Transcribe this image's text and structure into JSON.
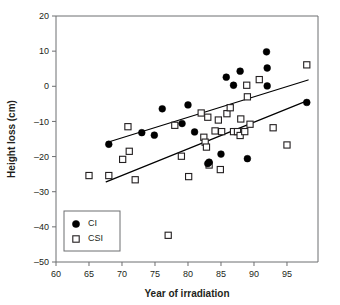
{
  "chart_data": {
    "type": "scatter",
    "title": "",
    "xlabel": "Year of irradiation",
    "ylabel": "Height loss (cm)",
    "xlim": [
      60,
      99.7
    ],
    "ylim": [
      -50,
      20
    ],
    "xticks": [
      60,
      65,
      70,
      75,
      80,
      85,
      90,
      95
    ],
    "yticks": [
      20,
      10,
      0,
      -10,
      -20,
      -30,
      -40,
      -50
    ],
    "xticklabels": [
      "60",
      "65",
      "70",
      "75",
      "80",
      "85",
      "90",
      "95"
    ],
    "yticklabels": [
      "20",
      "10",
      "0",
      "–10",
      "–20",
      "–30",
      "–40",
      "–50"
    ],
    "grid": false,
    "legend_position": "lower-left",
    "series": [
      {
        "name": "CI",
        "marker": "filled-circle",
        "color": "#000000",
        "points": [
          [
            68.0,
            -16.5
          ],
          [
            73.0,
            -13.2
          ],
          [
            74.9,
            -13.9
          ],
          [
            76.1,
            -6.4
          ],
          [
            79.1,
            -10.6
          ],
          [
            80.0,
            -5.3
          ],
          [
            81.0,
            -13.0
          ],
          [
            83.0,
            -22.0
          ],
          [
            83.2,
            -21.6
          ],
          [
            85.0,
            -19.3
          ],
          [
            85.8,
            2.6
          ],
          [
            86.9,
            0.3
          ],
          [
            87.9,
            4.3
          ],
          [
            89.0,
            -20.6
          ],
          [
            91.9,
            9.8
          ],
          [
            92.0,
            5.2
          ],
          [
            92.0,
            0.1
          ],
          [
            98.0,
            -4.6
          ]
        ]
      },
      {
        "name": "CSI",
        "marker": "open-square",
        "color": "#ffffff",
        "points": [
          [
            65.0,
            -25.4
          ],
          [
            68.0,
            -25.4
          ],
          [
            70.1,
            -20.8
          ],
          [
            70.9,
            -11.5
          ],
          [
            71.1,
            -18.5
          ],
          [
            72.0,
            -26.6
          ],
          [
            77.0,
            -42.4
          ],
          [
            78.0,
            -11.1
          ],
          [
            79.0,
            -19.9
          ],
          [
            80.1,
            -25.7
          ],
          [
            82.0,
            -7.6
          ],
          [
            82.4,
            -14.5
          ],
          [
            82.6,
            -15.9
          ],
          [
            82.8,
            -17.3
          ],
          [
            83.0,
            -8.8
          ],
          [
            83.2,
            -22.4
          ],
          [
            84.1,
            -12.7
          ],
          [
            84.6,
            -9.6
          ],
          [
            84.9,
            -23.7
          ],
          [
            85.1,
            -12.9
          ],
          [
            85.9,
            -7.8
          ],
          [
            86.4,
            -6.1
          ],
          [
            86.9,
            -12.9
          ],
          [
            87.5,
            -12.9
          ],
          [
            87.9,
            -14.0
          ],
          [
            88.0,
            -9.3
          ],
          [
            88.6,
            -12.9
          ],
          [
            88.9,
            0.3
          ],
          [
            89.0,
            -3.0
          ],
          [
            89.4,
            -10.8
          ],
          [
            90.8,
            1.9
          ],
          [
            92.9,
            -11.8
          ],
          [
            95.0,
            -16.7
          ],
          [
            98.0,
            6.1
          ]
        ]
      }
    ],
    "fit_lines": [
      {
        "name": "CI-fit",
        "x0": 68.2,
        "y0": -15.7,
        "x1": 98.2,
        "y1": 1.8
      },
      {
        "name": "CSI-fit",
        "x0": 67.6,
        "y0": -27.2,
        "x1": 98.2,
        "y1": -4.0
      }
    ],
    "legend": [
      {
        "label": "CI",
        "marker": "filled-circle"
      },
      {
        "label": "CSI",
        "marker": "open-square"
      }
    ]
  }
}
